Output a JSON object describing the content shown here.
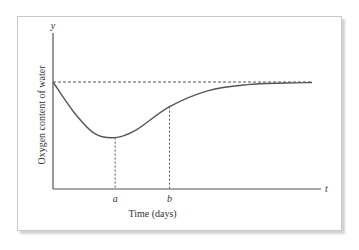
{
  "chart_data": {
    "type": "line",
    "title": "",
    "xlabel": "Time (days)",
    "ylabel": "Oxygen content of water",
    "x_axis_symbol": "t",
    "y_axis_symbol": "y",
    "grid": false,
    "legend": "none",
    "x_marks": [
      {
        "label": "a",
        "x": 0.24,
        "meaning": "minimum of oxygen content"
      },
      {
        "label": "b",
        "x": 0.45,
        "meaning": "inflection point"
      }
    ],
    "reference_line": {
      "type": "horizontal-dashed",
      "y": 1.0,
      "meaning": "initial / normal oxygen level"
    },
    "curve": {
      "description": "Oxygen content starts at normal level, drops to a minimum at t=a, rises with an inflection at t=b, then asymptotically approaches the normal level",
      "x": [
        0,
        0.08,
        0.16,
        0.24,
        0.32,
        0.45,
        0.6,
        0.75,
        0.9,
        1.0
      ],
      "y": [
        1.0,
        0.72,
        0.52,
        0.48,
        0.55,
        0.77,
        0.92,
        0.975,
        0.99,
        0.995
      ]
    },
    "xlim": [
      0,
      1.05
    ],
    "ylim": [
      0,
      1.25
    ],
    "colors": {
      "curve": "#555555",
      "axes": "#555555",
      "dashes": "#555555"
    }
  }
}
